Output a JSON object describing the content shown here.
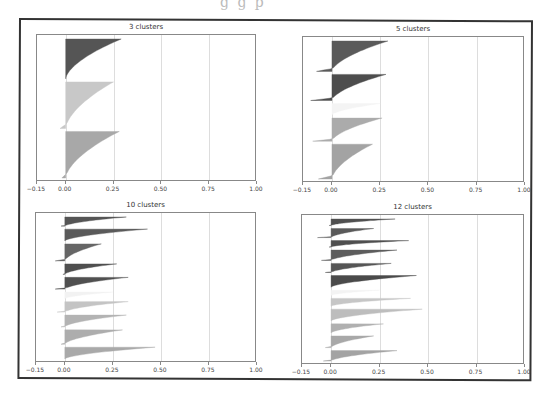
{
  "page": {
    "top_cut_text": "g g p"
  },
  "chart_data": [
    {
      "type": "area",
      "title": "3 clusters",
      "xlabel": "",
      "ylabel": "",
      "xlim": [
        -0.15,
        1.0
      ],
      "xticks": [
        "-0.15",
        "0.00",
        "0.25",
        "0.50",
        "0.75",
        "1.00"
      ],
      "grid": "vertical",
      "legend": "none",
      "description": "Silhouette plot, horizontal filled silhouettes per cluster, sorted",
      "clusters": [
        {
          "id": 0,
          "color": "#555555",
          "max": 0.29,
          "min": 0.0,
          "size_frac": 0.3
        },
        {
          "id": 1,
          "color": "#c8c8c8",
          "max": 0.25,
          "min": -0.03,
          "size_frac": 0.35
        },
        {
          "id": 2,
          "color": "#a8a8a8",
          "max": 0.28,
          "min": -0.02,
          "size_frac": 0.35
        }
      ]
    },
    {
      "type": "area",
      "title": "5 clusters",
      "xlabel": "",
      "ylabel": "",
      "xlim": [
        -0.15,
        1.0
      ],
      "xticks": [
        "-0.15",
        "0.00",
        "0.25",
        "0.50",
        "0.75",
        "1.00"
      ],
      "grid": "vertical",
      "legend": "none",
      "clusters": [
        {
          "id": 0,
          "color": "#5a5a5a",
          "max": 0.29,
          "min": -0.08,
          "size_frac": 0.21
        },
        {
          "id": 1,
          "color": "#4d4d4d",
          "max": 0.28,
          "min": -0.11,
          "size_frac": 0.18
        },
        {
          "id": 2,
          "color": "#f4f4f4",
          "max": 0.25,
          "min": 0.0,
          "size_frac": 0.08
        },
        {
          "id": 3,
          "color": "#ababab",
          "max": 0.26,
          "min": -0.1,
          "size_frac": 0.16
        },
        {
          "id": 4,
          "color": "#a3a3a3",
          "max": 0.21,
          "min": -0.07,
          "size_frac": 0.24
        }
      ]
    },
    {
      "type": "area",
      "title": "10 clusters",
      "xlabel": "",
      "ylabel": "",
      "xlim": [
        -0.15,
        1.0
      ],
      "xticks": [
        "-0.15",
        "0.00",
        "0.25",
        "0.50",
        "0.75",
        "1.00"
      ],
      "grid": "vertical",
      "legend": "none",
      "clusters": [
        {
          "id": 0,
          "color": "#555555",
          "max": 0.32,
          "min": -0.02,
          "size_frac": 0.07
        },
        {
          "id": 1,
          "color": "#5a5a5a",
          "max": 0.43,
          "min": 0.0,
          "size_frac": 0.09
        },
        {
          "id": 2,
          "color": "#666666",
          "max": 0.19,
          "min": -0.05,
          "size_frac": 0.13
        },
        {
          "id": 3,
          "color": "#4f4f4f",
          "max": 0.27,
          "min": -0.01,
          "size_frac": 0.08
        },
        {
          "id": 4,
          "color": "#505050",
          "max": 0.33,
          "min": -0.05,
          "size_frac": 0.09
        },
        {
          "id": 5,
          "color": "#f2f2f2",
          "max": 0.25,
          "min": 0.0,
          "size_frac": 0.05
        },
        {
          "id": 6,
          "color": "#c4c4c4",
          "max": 0.33,
          "min": -0.04,
          "size_frac": 0.08
        },
        {
          "id": 7,
          "color": "#b3b3b3",
          "max": 0.32,
          "min": -0.02,
          "size_frac": 0.09
        },
        {
          "id": 8,
          "color": "#adadad",
          "max": 0.3,
          "min": -0.02,
          "size_frac": 0.11
        },
        {
          "id": 9,
          "color": "#a9a9a9",
          "max": 0.47,
          "min": 0.0,
          "size_frac": 0.09
        }
      ]
    },
    {
      "type": "area",
      "title": "12 clusters",
      "xlabel": "",
      "ylabel": "",
      "xlim": [
        -0.15,
        1.0
      ],
      "xticks": [
        "-0.15",
        "0.00",
        "0.25",
        "0.50",
        "0.75",
        "1.00"
      ],
      "grid": "vertical",
      "legend": "none",
      "clusters": [
        {
          "id": 0,
          "color": "#505050",
          "max": 0.33,
          "min": -0.01,
          "size_frac": 0.05
        },
        {
          "id": 1,
          "color": "#5a5a5a",
          "max": 0.22,
          "min": -0.07,
          "size_frac": 0.07
        },
        {
          "id": 2,
          "color": "#4f4f4f",
          "max": 0.4,
          "min": -0.01,
          "size_frac": 0.05
        },
        {
          "id": 3,
          "color": "#5d5d5d",
          "max": 0.34,
          "min": -0.05,
          "size_frac": 0.08
        },
        {
          "id": 4,
          "color": "#555555",
          "max": 0.31,
          "min": -0.03,
          "size_frac": 0.07
        },
        {
          "id": 5,
          "color": "#4a4a4a",
          "max": 0.44,
          "min": 0.0,
          "size_frac": 0.09
        },
        {
          "id": 6,
          "color": "#f3f3f3",
          "max": 0.25,
          "min": 0.0,
          "size_frac": 0.04
        },
        {
          "id": 7,
          "color": "#c6c6c6",
          "max": 0.41,
          "min": 0.0,
          "size_frac": 0.06
        },
        {
          "id": 8,
          "color": "#bdbdbd",
          "max": 0.47,
          "min": 0.0,
          "size_frac": 0.09
        },
        {
          "id": 9,
          "color": "#b0b0b0",
          "max": 0.27,
          "min": 0.0,
          "size_frac": 0.07
        },
        {
          "id": 10,
          "color": "#a8a8a8",
          "max": 0.22,
          "min": -0.03,
          "size_frac": 0.09
        },
        {
          "id": 11,
          "color": "#a3a3a3",
          "max": 0.34,
          "min": -0.04,
          "size_frac": 0.08
        }
      ]
    }
  ]
}
